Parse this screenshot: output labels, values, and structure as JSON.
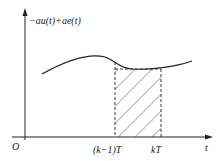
{
  "diagram": {
    "y_axis_label": "−au(t)+ae(t)",
    "x_axis_label": "t",
    "origin_label": "O",
    "tick_labels": [
      "(k−1)T",
      "kT"
    ],
    "shaded_region": "area under curve between (k−1)T and kT approximated by rectangle",
    "colors": {
      "line": "#222222",
      "background": "#ffffff"
    }
  }
}
